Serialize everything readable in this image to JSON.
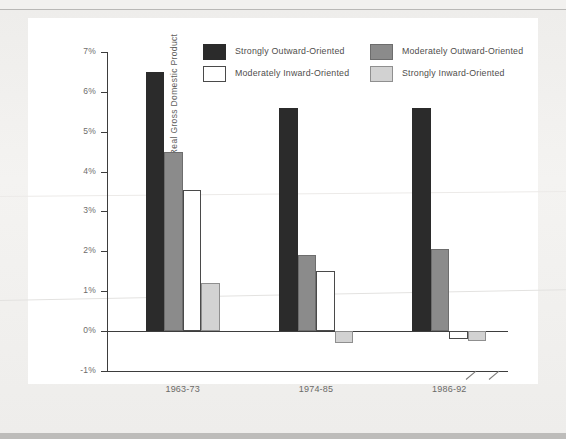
{
  "page": {
    "background_color": "#f2f1ef",
    "panel_color": "#ffffff",
    "top_cropped_text": "",
    "bottom_bar_color": "#bdbcba"
  },
  "chart_data": {
    "type": "bar",
    "title": "",
    "xlabel": "",
    "ylabel": "Average Annual Percentage Growth of Real Gross Domestic Product",
    "categories": [
      "1963-73",
      "1974-85",
      "1986-92"
    ],
    "ylim": [
      -1,
      7
    ],
    "ytick_labels": [
      "7%",
      "6%",
      "5%",
      "4%",
      "3%",
      "2%",
      "1%",
      "0%",
      "-1%"
    ],
    "ytick_values": [
      7,
      6,
      5,
      4,
      3,
      2,
      1,
      0,
      -1
    ],
    "ytick_suffix": "%",
    "grid": false,
    "legend_position": "top-center",
    "zero_line": 0,
    "series": [
      {
        "name": "Strongly Outward-Oriented",
        "color": "#2b2b2b",
        "border": "#2b2b2b",
        "values": [
          6.5,
          5.6,
          5.6
        ]
      },
      {
        "name": "Moderately Outward-Oriented",
        "color": "#8b8b8b",
        "border": "#6d6d6d",
        "values": [
          4.5,
          1.9,
          2.05
        ]
      },
      {
        "name": "Moderately Inward-Oriented",
        "color": "#ffffff",
        "border": "#4a4a4a",
        "values": [
          3.55,
          1.5,
          -0.2
        ]
      },
      {
        "name": "Strongly Inward-Oriented",
        "color": "#d2d2d2",
        "border": "#8f8f8f",
        "values": [
          1.2,
          -0.3,
          -0.25
        ]
      }
    ]
  },
  "legend": {
    "items": [
      {
        "label": "Strongly Outward-Oriented",
        "swatch": "s0"
      },
      {
        "label": "Moderately Outward-Oriented",
        "swatch": "s1"
      },
      {
        "label": "Moderately Inward-Oriented",
        "swatch": "s2"
      },
      {
        "label": "Strongly Inward-Oriented",
        "swatch": "s3"
      }
    ]
  }
}
